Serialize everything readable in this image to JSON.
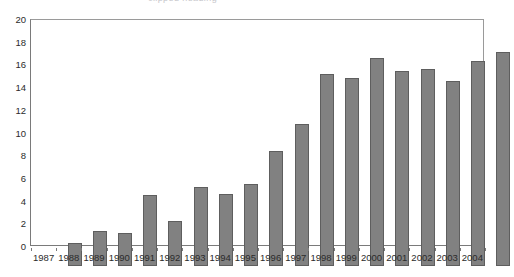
{
  "chart_data": {
    "type": "bar",
    "title": "",
    "xlabel": "",
    "ylabel": "",
    "ylim": [
      0,
      20
    ],
    "ytick_step": 2,
    "yticks": [
      0,
      2,
      4,
      6,
      8,
      10,
      12,
      14,
      16,
      18,
      20
    ],
    "grid": false,
    "legend": false,
    "legend_position": "none",
    "bar_color": "#818181",
    "bar_edge_color": "#5e5e5e",
    "axis_color": "#7a7a7a",
    "categories": [
      "1987",
      "1988",
      "1989",
      "1990",
      "1991",
      "1992",
      "1993",
      "1994",
      "1995",
      "1996",
      "1997",
      "1998",
      "1999",
      "2000",
      "2001",
      "2002",
      "2003",
      "2004"
    ],
    "values": [
      2.0,
      3.1,
      2.9,
      6.3,
      4.0,
      7.0,
      6.4,
      7.3,
      10.2,
      12.6,
      17.0,
      16.6,
      18.4,
      17.3,
      17.4,
      16.4,
      18.1,
      18.9
    ]
  },
  "header": {
    "clipped_title": "clipped heading"
  }
}
